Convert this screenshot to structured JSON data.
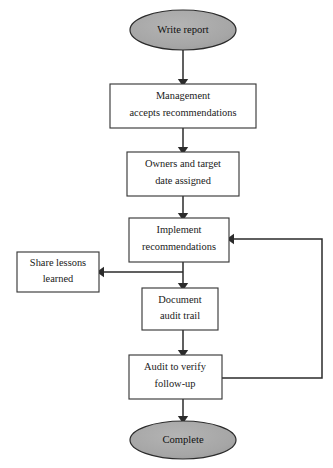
{
  "diagram": {
    "type": "flowchart",
    "background_color": "#ffffff",
    "line_color": "#2b2b2b",
    "box_fill": "#ffffff",
    "box_stroke": "#3a3a3a",
    "terminator_fill": "#a8a8a8",
    "terminator_stroke": "#2b2b2b",
    "text_color": "#1a1a1a"
  },
  "nodes": {
    "start": {
      "shape": "ellipse",
      "label": "Write report",
      "cx": 183,
      "cy": 30,
      "rx": 53,
      "ry": 20
    },
    "management": {
      "shape": "rectangle",
      "line1": "Management",
      "line2": "accepts recommendations",
      "x": 110,
      "y": 84,
      "width": 146,
      "height": 44
    },
    "owners": {
      "shape": "rectangle",
      "line1": "Owners and target",
      "line2": "date assigned",
      "x": 127,
      "y": 152,
      "width": 112,
      "height": 44
    },
    "implement": {
      "shape": "rectangle",
      "line1": "Implement",
      "line2": "recommendations",
      "x": 129,
      "y": 218,
      "width": 100,
      "height": 44
    },
    "share_lessons": {
      "shape": "rectangle",
      "line1": "Share lessons",
      "line2": "learned",
      "x": 17,
      "y": 252,
      "width": 82,
      "height": 40
    },
    "document_audit": {
      "shape": "rectangle",
      "line1": "Document",
      "line2": "audit trail",
      "x": 142,
      "y": 288,
      "width": 76,
      "height": 42
    },
    "audit_verify": {
      "shape": "rectangle",
      "line1": "Audit to verify",
      "line2": "follow-up",
      "x": 129,
      "y": 355,
      "width": 93,
      "height": 44
    },
    "complete": {
      "shape": "ellipse",
      "label": "Complete",
      "cx": 183,
      "cy": 440,
      "rx": 53,
      "ry": 19
    }
  },
  "edges": [
    {
      "name": "start-to-management",
      "from": "start",
      "to": "management",
      "arrowhead": true
    },
    {
      "name": "management-to-owners",
      "from": "management",
      "to": "owners",
      "arrowhead": true
    },
    {
      "name": "owners-to-implement",
      "from": "owners",
      "to": "implement",
      "arrowhead": true
    },
    {
      "name": "implement-to-share-lessons",
      "from": "implement",
      "to": "share_lessons",
      "arrowhead": true
    },
    {
      "name": "implement-to-document-audit",
      "from": "implement",
      "to": "document_audit",
      "arrowhead": true
    },
    {
      "name": "document-audit-to-audit-verify",
      "from": "document_audit",
      "to": "audit_verify",
      "arrowhead": true
    },
    {
      "name": "audit-verify-to-complete",
      "from": "audit_verify",
      "to": "complete",
      "arrowhead": true
    },
    {
      "name": "audit-verify-feedback-to-implement",
      "from": "audit_verify",
      "to": "implement",
      "arrowhead": true,
      "routing": "right-up-left"
    }
  ]
}
